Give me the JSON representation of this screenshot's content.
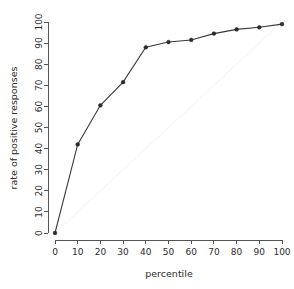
{
  "chart_data": {
    "type": "line",
    "title": "",
    "xlabel": "percentile",
    "ylabel": "rate of positive responses",
    "xlim": [
      0,
      100
    ],
    "ylim": [
      0,
      100
    ],
    "grid": false,
    "legend": "none",
    "x": [
      0,
      10,
      20,
      30,
      40,
      50,
      60,
      70,
      80,
      90,
      100
    ],
    "series": [
      {
        "name": "rate of positive responses",
        "marker": "filled-circle",
        "color": "#3a3a3a",
        "values": [
          0,
          42,
          60.5,
          71.5,
          88,
          90.5,
          91.5,
          94.5,
          96.5,
          97.5,
          99
        ]
      },
      {
        "name": "reference diagonal",
        "marker": "none",
        "color": "#f2f2f2",
        "values": [
          0,
          10,
          20,
          30,
          40,
          50,
          60,
          70,
          80,
          90,
          100
        ]
      }
    ],
    "xticks": [
      0,
      10,
      20,
      30,
      40,
      50,
      60,
      70,
      80,
      90,
      100
    ],
    "yticks": [
      0,
      10,
      20,
      30,
      40,
      50,
      60,
      70,
      80,
      90,
      100
    ],
    "xtick_labels": [
      "0",
      "10",
      "20",
      "30",
      "40",
      "50",
      "60",
      "70",
      "80",
      "90",
      "100"
    ],
    "ytick_labels": [
      "0",
      "10",
      "20",
      "30",
      "40",
      "50",
      "60",
      "70",
      "80",
      "90",
      "100"
    ]
  }
}
